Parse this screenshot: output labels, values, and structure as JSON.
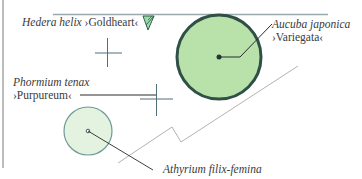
{
  "diagram": {
    "type": "planting-plan",
    "colors": {
      "large_fill": "#b8e2aa",
      "large_stroke": "#2f4f47",
      "small_fill": "#e3f3e0",
      "small_stroke": "#6f9a98",
      "line": "#6a7f8a",
      "boundary": "#9aa8b0",
      "text": "#3a3a3a"
    },
    "labels": {
      "hedera": {
        "species": "Hedera helix",
        "cultivar": "›Goldheart‹"
      },
      "aucuba": {
        "species": "Aucuba japonica",
        "cultivar": "›Variegata‹"
      },
      "phormium": {
        "species": "Phormium tenax",
        "cultivar": "›Purpureum‹"
      },
      "athyrium": {
        "species": "Athyrium filix-femina"
      }
    },
    "symbols": [
      {
        "name": "hedera-marker",
        "kind": "triangle",
        "x": 148,
        "y": 20
      },
      {
        "name": "aucuba-circle",
        "kind": "circle",
        "cx": 219,
        "cy": 57,
        "r": 43
      },
      {
        "name": "athyrium-circle",
        "kind": "circle",
        "cx": 88,
        "cy": 131,
        "r": 25
      },
      {
        "name": "cross-upper",
        "kind": "cross",
        "cx": 108,
        "cy": 53
      },
      {
        "name": "cross-phormium",
        "kind": "cross",
        "cx": 156,
        "cy": 99
      }
    ]
  }
}
